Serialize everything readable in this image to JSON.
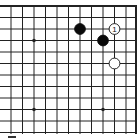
{
  "diagram": {
    "type": "go-board-fragment",
    "corner": "top-right",
    "colors": {
      "background": "#ffffff",
      "line": "#222222",
      "black_stone": "#0a0a0a",
      "white_stone": "#ffffff"
    },
    "columns": 12,
    "rows": 12,
    "star_points": [
      {
        "col": 2,
        "row": 3
      },
      {
        "col": 2,
        "row": 9
      },
      {
        "col": 8,
        "row": 9
      }
    ],
    "stones": [
      {
        "color": "black",
        "col": 6,
        "row": 2,
        "label": ""
      },
      {
        "color": "black",
        "col": 8,
        "row": 3,
        "label": ""
      },
      {
        "color": "white",
        "col": 9,
        "row": 2,
        "label": "1"
      },
      {
        "color": "white",
        "col": 9,
        "row": 5,
        "label": ""
      }
    ]
  }
}
